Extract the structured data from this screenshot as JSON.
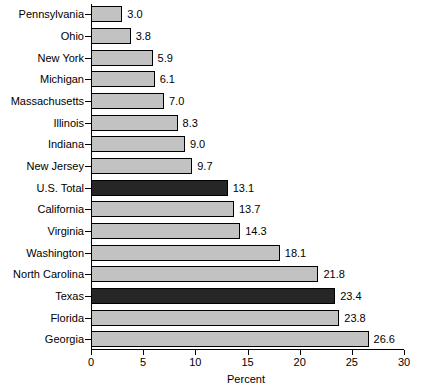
{
  "chart_data": {
    "type": "bar",
    "orientation": "horizontal",
    "title": "",
    "xlabel": "Percent",
    "ylabel": "",
    "xlim": [
      0,
      30
    ],
    "xticks": [
      0,
      5,
      10,
      15,
      20,
      25,
      30
    ],
    "grid": false,
    "legend": "none",
    "categories": [
      "Pennsylvania",
      "Ohio",
      "New York",
      "Michigan",
      "Massachusetts",
      "Illinois",
      "Indiana",
      "New Jersey",
      "U.S. Total",
      "California",
      "Virginia",
      "Washington",
      "North Carolina",
      "Texas",
      "Florida",
      "Georgia"
    ],
    "values": [
      3.0,
      3.8,
      5.9,
      6.1,
      7.0,
      8.3,
      9.0,
      9.7,
      13.1,
      13.7,
      14.3,
      18.1,
      21.8,
      23.4,
      23.8,
      26.6
    ],
    "value_labels": [
      "3.0",
      "3.8",
      "5.9",
      "6.1",
      "7.0",
      "8.3",
      "9.0",
      "9.7",
      "13.1",
      "13.7",
      "14.3",
      "18.1",
      "21.8",
      "23.4",
      "23.8",
      "26.6"
    ],
    "highlighted": [
      false,
      false,
      false,
      false,
      false,
      false,
      false,
      false,
      true,
      false,
      false,
      false,
      false,
      true,
      false,
      false
    ],
    "colors": {
      "bar_fill": "#c2c2c2",
      "bar_highlight_fill": "#262626",
      "bar_outline": "#000000",
      "background": "#ffffff",
      "text": "#000000"
    }
  }
}
